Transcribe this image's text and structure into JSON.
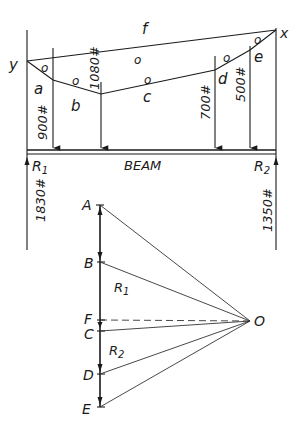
{
  "space_diagram": {
    "points": {
      "y": "y",
      "x": "x",
      "a": "a",
      "b": "b",
      "c": "c",
      "d": "d",
      "e": "e",
      "f": "f"
    },
    "loads": [
      {
        "label": "900#",
        "value": 900
      },
      {
        "label": "1080#",
        "value": 1080
      },
      {
        "label": "700#",
        "value": 700
      },
      {
        "label": "500#",
        "value": 500
      }
    ],
    "reactions": [
      {
        "name": "R1",
        "label": "R",
        "sub": "1",
        "value_label": "1830#",
        "value": 1830
      },
      {
        "name": "R2",
        "label": "R",
        "sub": "2",
        "value_label": "1350#",
        "value": 1350
      }
    ],
    "beam_label": "BEAM",
    "pole_marks": "o"
  },
  "force_polygon": {
    "points": [
      "A",
      "B",
      "F",
      "C",
      "D",
      "E"
    ],
    "pole": "O",
    "r1_label": "R",
    "r1_sub": "1",
    "r2_label": "R",
    "r2_sub": "2"
  }
}
